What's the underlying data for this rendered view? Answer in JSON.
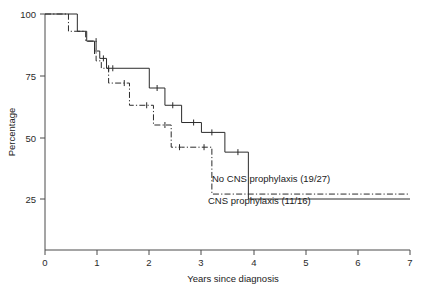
{
  "chart_data": {
    "type": "line",
    "subtype": "kaplan-meier-step",
    "title": "",
    "xlabel": "Years since diagnosis",
    "ylabel": "Percentage",
    "xlim": [
      0,
      7
    ],
    "ylim": [
      0,
      100
    ],
    "xticks": [
      "0",
      "1",
      "2",
      "3",
      "4",
      "5",
      "6",
      "7"
    ],
    "xtick_values": [
      0,
      1,
      2,
      3,
      4,
      5,
      6,
      7
    ],
    "yticks": [
      "25",
      "50",
      "75",
      "100"
    ],
    "ytick_values": [
      25,
      50,
      75,
      100
    ],
    "grid": false,
    "legend_position": "inline-annotation",
    "series": [
      {
        "name": "No CNS prophylaxis (19/27)",
        "label": "No CNS prophylaxis (19/27)",
        "style": "solid",
        "color": "#2b2b2b",
        "events": "19/27",
        "points": [
          [
            0.0,
            100
          ],
          [
            0.62,
            100
          ],
          [
            0.62,
            93
          ],
          [
            0.8,
            93
          ],
          [
            0.8,
            89
          ],
          [
            0.95,
            89
          ],
          [
            0.95,
            85
          ],
          [
            1.05,
            85
          ],
          [
            1.05,
            82
          ],
          [
            1.18,
            82
          ],
          [
            1.18,
            78
          ],
          [
            1.3,
            78
          ],
          [
            1.3,
            78
          ],
          [
            2.0,
            78
          ],
          [
            2.0,
            70
          ],
          [
            2.3,
            70
          ],
          [
            2.3,
            63
          ],
          [
            2.62,
            63
          ],
          [
            2.62,
            56
          ],
          [
            3.0,
            56
          ],
          [
            3.0,
            52
          ],
          [
            3.45,
            52
          ],
          [
            3.45,
            44
          ],
          [
            3.9,
            44
          ],
          [
            3.9,
            25
          ],
          [
            7.0,
            25
          ]
        ],
        "censor_marks": [
          [
            0.95,
            85
          ],
          [
            1.12,
            82
          ],
          [
            1.3,
            78
          ],
          [
            2.15,
            70
          ],
          [
            2.45,
            63
          ],
          [
            2.85,
            56
          ],
          [
            3.2,
            52
          ],
          [
            3.7,
            44
          ]
        ]
      },
      {
        "name": "CNS prophylaxis (11/16)",
        "label": "CNS prophylaxis (11/16)",
        "style": "dash-dot",
        "color": "#2b2b2b",
        "events": "11/16",
        "points": [
          [
            0.0,
            100
          ],
          [
            0.45,
            100
          ],
          [
            0.45,
            93
          ],
          [
            0.78,
            93
          ],
          [
            0.78,
            89
          ],
          [
            0.98,
            89
          ],
          [
            0.98,
            81
          ],
          [
            1.08,
            81
          ],
          [
            1.08,
            78
          ],
          [
            1.22,
            78
          ],
          [
            1.22,
            72
          ],
          [
            1.32,
            72
          ],
          [
            1.32,
            72
          ],
          [
            1.62,
            72
          ],
          [
            1.62,
            63
          ],
          [
            2.08,
            63
          ],
          [
            2.08,
            55
          ],
          [
            2.42,
            55
          ],
          [
            2.42,
            46
          ],
          [
            2.62,
            46
          ],
          [
            2.62,
            46
          ],
          [
            3.2,
            46
          ],
          [
            3.2,
            27
          ],
          [
            7.0,
            27
          ]
        ],
        "censor_marks": [
          [
            0.98,
            89
          ],
          [
            1.22,
            78
          ],
          [
            1.52,
            72
          ],
          [
            1.95,
            63
          ],
          [
            2.3,
            55
          ],
          [
            2.58,
            46
          ],
          [
            3.05,
            46
          ]
        ]
      }
    ]
  },
  "axes": {
    "y_label": "Percentage",
    "x_label": "Years since diagnosis",
    "y_tick_100": "100",
    "y_tick_75": "75",
    "y_tick_50": "50",
    "y_tick_25": "25",
    "x_tick_0": "0",
    "x_tick_1": "1",
    "x_tick_2": "2",
    "x_tick_3": "3",
    "x_tick_4": "4",
    "x_tick_5": "5",
    "x_tick_6": "6",
    "x_tick_7": "7"
  },
  "annotations": {
    "series_1_label": "No CNS prophylaxis (19/27)",
    "series_2_label": "CNS prophylaxis (11/16)"
  },
  "colors": {
    "ink": "#2b2b2b",
    "axis": "#4a4a4a",
    "background": "#ffffff"
  }
}
